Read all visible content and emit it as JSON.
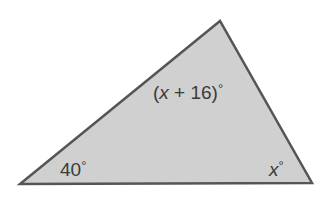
{
  "diagram": {
    "type": "triangle",
    "fill_color": "#d0d0d0",
    "stroke_color": "#555555",
    "vertices": {
      "top": [
        220,
        21
      ],
      "bottom_left": [
        20,
        184
      ],
      "bottom_right": [
        312,
        183
      ]
    },
    "angles": {
      "top": {
        "open": "(",
        "var": "x",
        "rest": " + 16)",
        "degree": "°"
      },
      "bottom_left": {
        "value": "40",
        "degree": "°"
      },
      "bottom_right": {
        "var": "x",
        "degree": "°"
      }
    }
  }
}
